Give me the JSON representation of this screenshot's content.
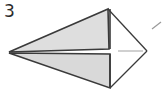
{
  "figure": {
    "label": "3",
    "caption_text": "3",
    "background_color": "#ffffff",
    "label_color": "#2b2b2b",
    "fill_color": "#dedede",
    "fill_color_lower": "#d9d9d9",
    "stroke_color": "#3a3a3a",
    "stroke_color_light": "#9a9a9a",
    "leader_line_color": "#b0b0b0",
    "shape_name": "paper-airplane-wedge",
    "geometry": {
      "left_apex": [
        9,
        52
      ],
      "top_apex": [
        108,
        9
      ],
      "bottom_apex": [
        110,
        88
      ],
      "right_apex": [
        147,
        51
      ],
      "fold_x": 110,
      "fold_y_top": 49,
      "fold_y_bottom": 54,
      "upper_triangle_points": "9,52 108,9 109,49",
      "lower_triangle_points": "9,53 110,88 110,54",
      "upper_right_edge": "108,9 147,51",
      "lower_right_edge": "110,88 147,51",
      "leader_line": [
        118,
        51,
        143,
        51
      ],
      "tick_mark": [
        152,
        29,
        161,
        22
      ]
    }
  }
}
